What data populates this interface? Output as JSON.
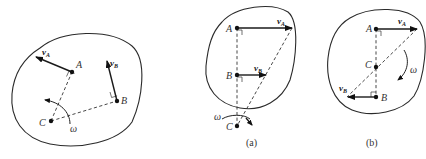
{
  "figure": {
    "panels": [
      {
        "id": "general",
        "caption": "",
        "points": {
          "A": "A",
          "B": "B",
          "C": "C"
        },
        "vectors": {
          "vA": "v",
          "vA_sub": "A",
          "vB": "v",
          "vB_sub": "B"
        },
        "angular_velocity": "ω"
      },
      {
        "id": "a",
        "caption": "(a)",
        "points": {
          "A": "A",
          "B": "B",
          "C": "C"
        },
        "vectors": {
          "vA": "v",
          "vA_sub": "A",
          "vB": "v",
          "vB_sub": "B"
        },
        "angular_velocity": "ω"
      },
      {
        "id": "b",
        "caption": "(b)",
        "points": {
          "A": "A",
          "B": "B",
          "C": "C"
        },
        "vectors": {
          "vA": "v",
          "vA_sub": "A",
          "vB": "v",
          "vB_sub": "B"
        },
        "angular_velocity": "ω"
      }
    ]
  },
  "colors": {
    "stroke": "#2a2a2a",
    "background": "#ffffff"
  }
}
